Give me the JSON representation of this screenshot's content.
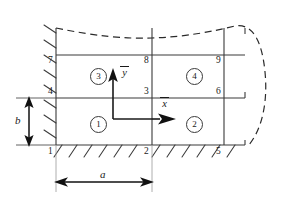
{
  "figure": {
    "type": "finite-element-mesh-diagram",
    "colors": {
      "line": "#3a3a3a",
      "text": "#1a1a1a",
      "background": "#ffffff"
    }
  },
  "nodes": [
    {
      "id": "1",
      "label": "1",
      "x": 56,
      "y": 145,
      "anchor": "below-left"
    },
    {
      "id": "2",
      "label": "2",
      "x": 152,
      "y": 145,
      "anchor": "below-left"
    },
    {
      "id": "3",
      "label": "3",
      "x": 152,
      "y": 98,
      "anchor": "above-left"
    },
    {
      "id": "4",
      "label": "4",
      "x": 56,
      "y": 98,
      "anchor": "above-right"
    },
    {
      "id": "5",
      "label": "5",
      "x": 224,
      "y": 145,
      "anchor": "below-left"
    },
    {
      "id": "6",
      "label": "6",
      "x": 224,
      "y": 98,
      "anchor": "above-left"
    },
    {
      "id": "7",
      "label": "7",
      "x": 56,
      "y": 55,
      "anchor": "below-right"
    },
    {
      "id": "8",
      "label": "8",
      "x": 152,
      "y": 55,
      "anchor": "below-left"
    },
    {
      "id": "9",
      "label": "9",
      "x": 224,
      "y": 55,
      "anchor": "below-left"
    }
  ],
  "elements": [
    {
      "id": "1",
      "label": "1",
      "cx": 98,
      "cy": 123
    },
    {
      "id": "2",
      "label": "2",
      "cx": 194,
      "cy": 123
    },
    {
      "id": "3",
      "label": "3",
      "cx": 98,
      "cy": 75
    },
    {
      "id": "4",
      "label": "4",
      "cx": 194,
      "cy": 75
    }
  ],
  "axes": {
    "origin_node": "3",
    "x_axis": {
      "label": "x",
      "overbar": true,
      "direction": "right"
    },
    "y_axis": {
      "label": "y",
      "overbar": true,
      "direction": "up"
    }
  },
  "dimensions": [
    {
      "name": "a",
      "label": "a",
      "orientation": "horizontal",
      "from_node": "1",
      "to_node": "2"
    },
    {
      "name": "b",
      "label": "b",
      "orientation": "vertical",
      "from_node": "1",
      "to_node": "4"
    }
  ],
  "supports": [
    {
      "name": "left-fixed-edge",
      "orientation": "vertical",
      "style": "hatched"
    },
    {
      "name": "bottom-fixed-edge",
      "orientation": "horizontal",
      "style": "hatched"
    }
  ],
  "boundary_curve": {
    "name": "true-body-outline",
    "style": "dashed",
    "note": "curved actual boundary extending beyond the meshed region"
  }
}
